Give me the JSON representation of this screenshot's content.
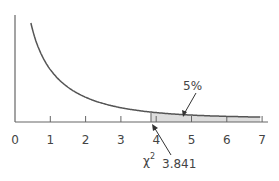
{
  "chart_data": {
    "type": "line",
    "title": "",
    "xlabel": "",
    "ylabel": "",
    "xlim": [
      0,
      7
    ],
    "x_ticks": [
      0,
      1,
      2,
      3,
      4,
      5,
      6,
      7
    ],
    "tick_labels": [
      "0",
      "1",
      "2",
      "3",
      "4",
      "5",
      "6",
      "7"
    ],
    "grid": false,
    "legend": null,
    "series": [
      {
        "name": "chi-square density (df=1)",
        "x": [
          0.45,
          0.6,
          0.8,
          1.0,
          1.5,
          2.0,
          2.5,
          3.0,
          3.5,
          3.841,
          4.5,
          5.0,
          6.0,
          7.0
        ]
      }
    ],
    "shaded_region": {
      "from": 3.841,
      "to": 7,
      "label": "5%"
    },
    "annotations": [
      {
        "text": "5%",
        "points_to": "shaded tail area"
      },
      {
        "text": "χ²",
        "position": "below axis near 3.841"
      },
      {
        "text": "3.841",
        "points_to": "critical value on x-axis"
      }
    ]
  },
  "labels": {
    "tail_percent": "5%",
    "chi_symbol": "χ",
    "chi_superscript": "2",
    "critical_value": "3.841",
    "ticks": [
      "0",
      "1",
      "2",
      "3",
      "4",
      "5",
      "6",
      "7"
    ]
  },
  "colors": {
    "curve": "#555555",
    "axis": "#666666",
    "shade": "#dddddd",
    "text": "#444444"
  }
}
